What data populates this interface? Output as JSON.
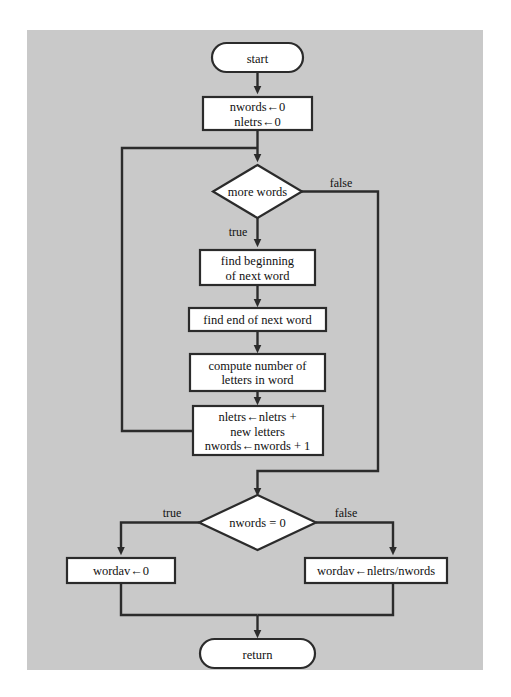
{
  "figure": {
    "type": "flowchart",
    "background_color": "#c9c9c9",
    "shape_fill": "#ffffff",
    "line_color": "#2b2b2b"
  },
  "nodes": [
    {
      "id": "start",
      "shape": "terminal",
      "lines": [
        "start"
      ]
    },
    {
      "id": "init",
      "shape": "process",
      "lines": [
        "nwords←0",
        "nletrs←0"
      ]
    },
    {
      "id": "more_words",
      "shape": "decision",
      "lines": [
        "more words"
      ]
    },
    {
      "id": "find_begin",
      "shape": "process",
      "lines": [
        "find beginning",
        "of next word"
      ]
    },
    {
      "id": "find_end",
      "shape": "process",
      "lines": [
        "find end of next word"
      ]
    },
    {
      "id": "compute",
      "shape": "process",
      "lines": [
        "compute number of",
        "letters in word"
      ]
    },
    {
      "id": "accumulate",
      "shape": "process",
      "lines": [
        "nletrs←nletrs +",
        "new letters",
        "nwords←nwords + 1"
      ]
    },
    {
      "id": "nwords_zero",
      "shape": "decision",
      "lines": [
        "nwords = 0"
      ]
    },
    {
      "id": "wordav_zero",
      "shape": "process",
      "lines": [
        "wordav←0"
      ]
    },
    {
      "id": "wordav_div",
      "shape": "process",
      "lines": [
        "wordav←nletrs/nwords"
      ]
    },
    {
      "id": "return",
      "shape": "terminal",
      "lines": [
        "return"
      ]
    }
  ],
  "edge_labels": {
    "more_words_false": "false",
    "more_words_true": "true",
    "nwords_zero_true": "true",
    "nwords_zero_false": "false"
  },
  "text": {
    "start": "start",
    "init_l1": "nwords←0",
    "init_l2": "nletrs←0",
    "more_words": "more words",
    "find_begin_l1": "find beginning",
    "find_begin_l2": "of next word",
    "find_end": "find end of next word",
    "compute_l1": "compute number of",
    "compute_l2": "letters in word",
    "accum_l1": "nletrs←nletrs +",
    "accum_l2": "new letters",
    "accum_l3": "nwords←nwords + 1",
    "nwords_zero": "nwords = 0",
    "wordav_zero": "wordav←0",
    "wordav_div": "wordav←nletrs/nwords",
    "return": "return",
    "label_false_top": "false",
    "label_true_top": "true",
    "label_true_bottom": "true",
    "label_false_bottom": "false"
  }
}
